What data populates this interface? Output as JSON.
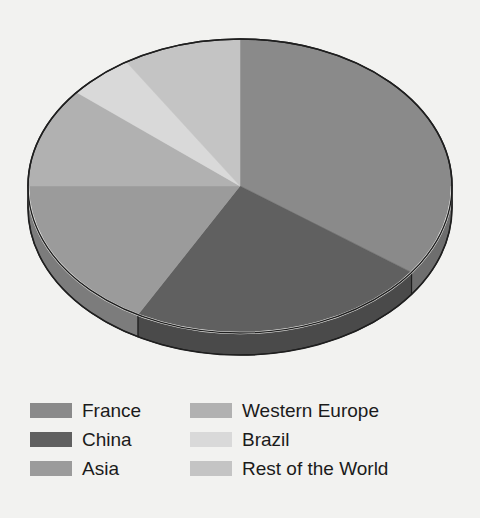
{
  "chart_data": {
    "type": "pie",
    "title": "",
    "subtitle": "",
    "xlabel": "",
    "ylabel": "",
    "three_d": true,
    "grid": false,
    "legend_position": "bottom",
    "legend_columns": 2,
    "start_angle_deg": 0,
    "direction": "clockwise",
    "categories": [
      "France",
      "China",
      "Asia",
      "Western Europe",
      "Brazil",
      "Rest of the World"
    ],
    "values": [
      35,
      23,
      17,
      11,
      5,
      9
    ],
    "units": "percent",
    "slices": [
      {
        "label": "France",
        "value": 35,
        "color": "#8a8a8a",
        "side_color": "#6e6e6e",
        "start_deg": 0,
        "end_deg": 126
      },
      {
        "label": "China",
        "value": 23,
        "color": "#606060",
        "side_color": "#4a4a4a",
        "start_deg": 126,
        "end_deg": 208.8
      },
      {
        "label": "Asia",
        "value": 17,
        "color": "#9b9b9b",
        "side_color": "#7c7c7c",
        "start_deg": 208.8,
        "end_deg": 270
      },
      {
        "label": "Western Europe",
        "value": 11,
        "color": "#b1b1b1",
        "side_color": "#8e8e8e",
        "start_deg": 270,
        "end_deg": 309.6
      },
      {
        "label": "Brazil",
        "value": 5,
        "color": "#d9d9d9",
        "side_color": "#adadad",
        "start_deg": 309.6,
        "end_deg": 327.6
      },
      {
        "label": "Rest of the World",
        "value": 9,
        "color": "#c4c4c4",
        "side_color": "#9d9d9d",
        "start_deg": 327.6,
        "end_deg": 360
      }
    ]
  },
  "legend": {
    "columns": [
      {
        "items": [
          {
            "label": "France",
            "color": "#8a8a8a"
          },
          {
            "label": "China",
            "color": "#606060"
          },
          {
            "label": "Asia",
            "color": "#9b9b9b"
          }
        ]
      },
      {
        "items": [
          {
            "label": "Western Europe",
            "color": "#b1b1b1"
          },
          {
            "label": "Brazil",
            "color": "#d9d9d9"
          },
          {
            "label": "Rest of the World",
            "color": "#c4c4c4"
          }
        ]
      }
    ]
  },
  "colors": {
    "background": "#f2f2f0",
    "outline": "#1f1f1f",
    "rim_highlight": "#f2f2f0",
    "text": "#1b1b1b"
  },
  "geometry": {
    "center_x": 240,
    "center_y": 186,
    "radius_x": 212,
    "radius_y": 147,
    "depth": 22
  }
}
